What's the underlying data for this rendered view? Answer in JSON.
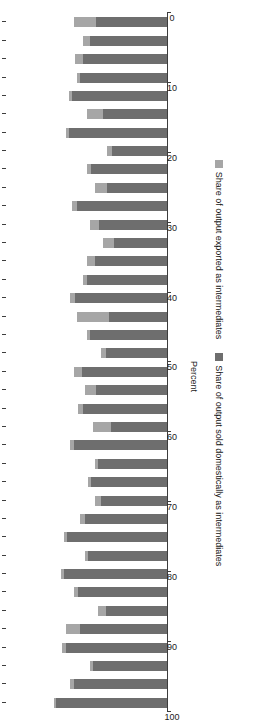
{
  "chart_data": {
    "type": "bar",
    "subtype": "stacked-horizontal",
    "title": "",
    "xlabel": "",
    "ylabel": "Percent",
    "ylim": [
      0,
      100
    ],
    "grid": false,
    "legend_position": "bottom",
    "tick_labels": [
      "0",
      "10",
      "20",
      "30",
      "40",
      "50",
      "60",
      "70",
      "80",
      "90",
      "100"
    ],
    "tick_values": [
      0,
      10,
      20,
      30,
      40,
      50,
      60,
      70,
      80,
      90,
      100
    ],
    "categories": [
      "Angola",
      "Benin",
      "Botswana",
      "Burkina Faso",
      "Burundi",
      "Cabo Verde",
      "Cameroon",
      "Chad",
      "Congo, Dem. Rep.",
      "Congo, Rep.",
      "Côte d'Ivoire",
      "Djibouti",
      "Eritrea",
      "Eswatini",
      "Gabon",
      "Gambia, The",
      "Ghana",
      "Guinea",
      "Kenya",
      "Lesotho",
      "Liberia",
      "Madagascar",
      "Malawi",
      "Mali",
      "Mauritania",
      "Mauritius",
      "Mozambique",
      "Namibia",
      "Niger",
      "Nigeria",
      "Rwanda",
      "Senegal",
      "Sierra Leone",
      "Sudan",
      "Tanzania",
      "Togo",
      "Uganda",
      "Zambia"
    ],
    "series": [
      {
        "name": "Share of output sold domestically as intermediates",
        "color": "#6e6e6e",
        "values": [
          69,
          58,
          46,
          63,
          54,
          38,
          55,
          64,
          49,
          62,
          51,
          41,
          47,
          43,
          58,
          35,
          52,
          44,
          53,
          38,
          48,
          36,
          57,
          50,
          45,
          33,
          42,
          56,
          37,
          47,
          34,
          61,
          40,
          59,
          54,
          52,
          48,
          44
        ]
      },
      {
        "name": "Share of output exported as intermediates",
        "color": "#a6a6a6",
        "values": [
          1,
          2,
          2,
          2,
          9,
          5,
          3,
          2,
          2,
          2,
          3,
          4,
          2,
          2,
          2,
          11,
          3,
          7,
          5,
          3,
          2,
          20,
          3,
          2,
          5,
          7,
          6,
          3,
          8,
          3,
          3,
          2,
          10,
          2,
          2,
          5,
          4,
          14
        ]
      }
    ]
  },
  "legend": {
    "items": [
      {
        "label": "Share of output sold domestically as intermediates",
        "color": "#6e6e6e"
      },
      {
        "label": "Share of output exported as intermediates",
        "color": "#a6a6a6"
      }
    ]
  },
  "axis": {
    "percent_label": "Percent"
  }
}
